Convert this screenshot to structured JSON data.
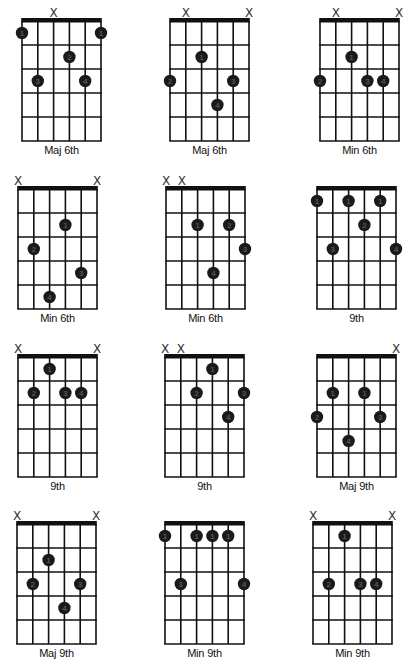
{
  "colors": {
    "line": "#111111",
    "dot": "#1a1a1a",
    "dot_text": "#555555",
    "background": "#ffffff"
  },
  "layout": {
    "string_spacing": 15.8,
    "fret_spacing": 24,
    "frets": 5,
    "strings": 6
  },
  "chords": [
    {
      "name": "Maj 6th",
      "x": 22,
      "y": 21,
      "muted": [
        2
      ],
      "dots": [
        [
          0,
          1,
          "1"
        ],
        [
          5,
          1,
          "1"
        ],
        [
          3,
          2,
          "2"
        ],
        [
          1,
          3,
          "3"
        ],
        [
          4,
          3,
          "4"
        ]
      ]
    },
    {
      "name": "Maj 6th",
      "x": 170,
      "y": 21,
      "muted": [
        1,
        5
      ],
      "dots": [
        [
          2,
          2,
          "1"
        ],
        [
          0,
          3,
          "2"
        ],
        [
          4,
          3,
          "3"
        ],
        [
          3,
          4,
          "4"
        ]
      ]
    },
    {
      "name": "Min 6th",
      "x": 320,
      "y": 21,
      "muted": [
        1,
        5
      ],
      "dots": [
        [
          2,
          2,
          "1"
        ],
        [
          0,
          3,
          "2"
        ],
        [
          3,
          3,
          "3"
        ],
        [
          4,
          3,
          "4"
        ]
      ]
    },
    {
      "name": "Min 6th",
      "x": 18,
      "y": 189,
      "muted": [
        0,
        5
      ],
      "dots": [
        [
          3,
          2,
          "1"
        ],
        [
          1,
          3,
          "2"
        ],
        [
          4,
          4,
          "3"
        ],
        [
          2,
          5,
          "4"
        ]
      ]
    },
    {
      "name": "Min 6th",
      "x": 166,
      "y": 189,
      "muted": [
        0,
        1
      ],
      "dots": [
        [
          2,
          2,
          "1"
        ],
        [
          4,
          2,
          "2"
        ],
        [
          5,
          3,
          "3"
        ],
        [
          3,
          4,
          "4"
        ]
      ]
    },
    {
      "name": "9th",
      "x": 317,
      "y": 189,
      "muted": [],
      "dots": [
        [
          0,
          1,
          "1"
        ],
        [
          2,
          1,
          "1"
        ],
        [
          4,
          1,
          "1"
        ],
        [
          3,
          2,
          "2"
        ],
        [
          1,
          3,
          "3"
        ],
        [
          5,
          3,
          "4"
        ]
      ]
    },
    {
      "name": "9th",
      "x": 18,
      "y": 357,
      "muted": [
        0,
        5
      ],
      "dots": [
        [
          2,
          1,
          "1"
        ],
        [
          1,
          2,
          "2"
        ],
        [
          3,
          2,
          "3"
        ],
        [
          4,
          2,
          "4"
        ]
      ]
    },
    {
      "name": "9th",
      "x": 165,
      "y": 357,
      "muted": [
        0,
        1
      ],
      "dots": [
        [
          3,
          1,
          "1"
        ],
        [
          2,
          2,
          "2"
        ],
        [
          5,
          2,
          "3"
        ],
        [
          4,
          3,
          "4"
        ]
      ]
    },
    {
      "name": "Maj 9th",
      "x": 317,
      "y": 357,
      "muted": [
        5
      ],
      "dots": [
        [
          1,
          2,
          "1"
        ],
        [
          3,
          2,
          "1"
        ],
        [
          0,
          3,
          "2"
        ],
        [
          4,
          3,
          "3"
        ],
        [
          2,
          4,
          "4"
        ]
      ]
    },
    {
      "name": "Maj 9th",
      "x": 17,
      "y": 524,
      "muted": [
        0,
        5
      ],
      "dots": [
        [
          2,
          2,
          "1"
        ],
        [
          1,
          3,
          "2"
        ],
        [
          4,
          3,
          "3"
        ],
        [
          3,
          4,
          "4"
        ]
      ]
    },
    {
      "name": "Min 9th",
      "x": 165,
      "y": 524,
      "muted": [],
      "dots": [
        [
          0,
          1,
          "1"
        ],
        [
          2,
          1,
          "1"
        ],
        [
          3,
          1,
          "1"
        ],
        [
          4,
          1,
          "1"
        ],
        [
          1,
          3,
          "3"
        ],
        [
          5,
          3,
          "4"
        ]
      ]
    },
    {
      "name": "Min 9th",
      "x": 313,
      "y": 524,
      "muted": [
        0,
        5
      ],
      "dots": [
        [
          2,
          1,
          "1"
        ],
        [
          1,
          3,
          "2"
        ],
        [
          3,
          3,
          "3"
        ],
        [
          4,
          3,
          "4"
        ]
      ]
    }
  ]
}
